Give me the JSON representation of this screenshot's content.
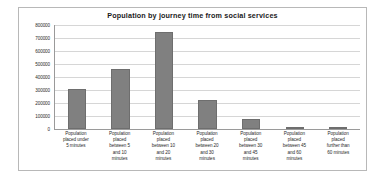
{
  "chart_data": {
    "type": "bar",
    "title": "Population by journey time from social services",
    "xlabel": "",
    "ylabel": "",
    "ylim": [
      0,
      800000
    ],
    "ytick_step": 100000,
    "yticks": [
      800000,
      700000,
      600000,
      500000,
      400000,
      300000,
      200000,
      100000,
      0
    ],
    "ytick_labels": [
      "800000",
      "700000",
      "600000",
      "500000",
      "400000",
      "300000",
      "200000",
      "100000",
      "0"
    ],
    "grid": true,
    "legend": false,
    "series_color": "#808080",
    "categories": [
      "Population placed under 5 minutes",
      "Population placed between 5 and 10 minutes",
      "Population placed between 10 and 20 minutes",
      "Population placed between 20 and 30 minutes",
      "Population placed between 30 and 45 minutes",
      "Population placed between 45 and 60 minutes",
      "Population placed further than 60 minutes"
    ],
    "category_lines": [
      [
        "Population",
        "placed under",
        "5 minutes"
      ],
      [
        "Population",
        "placed",
        "between 5",
        "and 10",
        "minutes"
      ],
      [
        "Population",
        "placed",
        "between 10",
        "and 20",
        "minutes"
      ],
      [
        "Population",
        "placed",
        "between 20",
        "and 30",
        "minutes"
      ],
      [
        "Population",
        "placed",
        "between 30",
        "and 45",
        "minutes"
      ],
      [
        "Population",
        "placed",
        "between 45",
        "and 60",
        "minutes"
      ],
      [
        "Population",
        "placed",
        "further than",
        "60 minutes"
      ]
    ],
    "values": [
      305000,
      460000,
      745000,
      225000,
      80000,
      15000,
      15000
    ]
  }
}
